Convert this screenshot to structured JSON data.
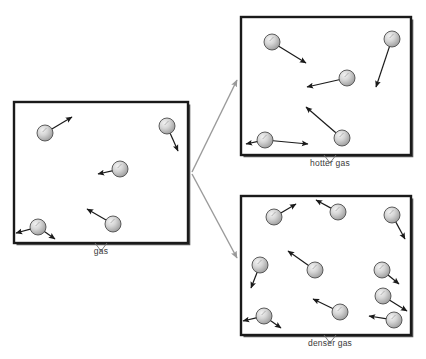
{
  "figure": {
    "background_color": "#ffffff",
    "box_border_color": "#1a1a1a",
    "particle_fill_light": "#e8e8e8",
    "particle_fill_dark": "#9a9a9a",
    "particle_outline": "#4d4d4d",
    "arrow_color": "#1a1a1a",
    "connector_color": "#9a9a9a",
    "label_color": "#3a3a3a"
  },
  "panels": [
    {
      "id": "gas",
      "label": "gas",
      "box": {
        "x": 14,
        "y": 102,
        "w": 174,
        "h": 141
      },
      "label_x": 101,
      "label_y": 246,
      "leader": {
        "from_x": 101,
        "from_y": 243,
        "left_x": 95,
        "right_x": 107,
        "tip_y": 251
      },
      "particle_count": 5,
      "particles": [
        {
          "cx": 45,
          "cy": 133,
          "r": 8,
          "ax": 27,
          "ay": -16
        },
        {
          "cx": 167,
          "cy": 126,
          "r": 8,
          "ax": 11,
          "ay": 25
        },
        {
          "cx": 120,
          "cy": 169,
          "r": 8,
          "ax": -22,
          "ay": 5
        },
        {
          "cx": 38,
          "cy": 227,
          "r": 8,
          "ax": -22,
          "ay": 6
        },
        {
          "cx": 113,
          "cy": 224,
          "r": 8,
          "ax": -26,
          "ay": -15
        }
      ],
      "extra_arrows": [
        {
          "x1": 38,
          "y1": 227,
          "x2": 55,
          "y2": 239
        }
      ]
    },
    {
      "id": "hotter-gas",
      "label": "hotter gas",
      "box": {
        "x": 241,
        "y": 17,
        "w": 170,
        "h": 138
      },
      "label_x": 330,
      "label_y": 158,
      "leader": {
        "from_x": 330,
        "from_y": 155,
        "left_x": 324,
        "right_x": 336,
        "tip_y": 163
      },
      "particle_count": 5,
      "particles": [
        {
          "cx": 272,
          "cy": 42,
          "r": 8,
          "ax": 34,
          "ay": 21
        },
        {
          "cx": 392,
          "cy": 39,
          "r": 8,
          "ax": -16,
          "ay": 48
        },
        {
          "cx": 347,
          "cy": 78,
          "r": 8,
          "ax": -40,
          "ay": 9
        },
        {
          "cx": 265,
          "cy": 140,
          "r": 8,
          "ax": -19,
          "ay": 4
        },
        {
          "cx": 342,
          "cy": 138,
          "r": 8,
          "ax": -36,
          "ay": -31
        }
      ],
      "extra_arrows": [
        {
          "x1": 265,
          "y1": 140,
          "x2": 308,
          "y2": 144
        }
      ]
    },
    {
      "id": "denser-gas",
      "label": "denser gas",
      "box": {
        "x": 241,
        "y": 196,
        "w": 170,
        "h": 139
      },
      "label_x": 330,
      "label_y": 338,
      "leader": {
        "from_x": 330,
        "from_y": 335,
        "left_x": 324,
        "right_x": 336,
        "tip_y": 343
      },
      "particle_count": 10,
      "particles": [
        {
          "cx": 274,
          "cy": 217,
          "r": 8,
          "ax": 22,
          "ay": -13
        },
        {
          "cx": 338,
          "cy": 212,
          "r": 8,
          "ax": -22,
          "ay": -12
        },
        {
          "cx": 392,
          "cy": 215,
          "r": 8,
          "ax": 13,
          "ay": 24
        },
        {
          "cx": 260,
          "cy": 265,
          "r": 8,
          "ax": -9,
          "ay": 23
        },
        {
          "cx": 315,
          "cy": 270,
          "r": 8,
          "ax": -27,
          "ay": -19
        },
        {
          "cx": 382,
          "cy": 270,
          "r": 8,
          "ax": 17,
          "ay": 14
        },
        {
          "cx": 383,
          "cy": 296,
          "r": 8,
          "ax": 24,
          "ay": 15
        },
        {
          "cx": 264,
          "cy": 316,
          "r": 8,
          "ax": -21,
          "ay": 5
        },
        {
          "cx": 340,
          "cy": 312,
          "r": 8,
          "ax": -27,
          "ay": -13
        },
        {
          "cx": 394,
          "cy": 320,
          "r": 8,
          "ax": -25,
          "ay": -4
        }
      ],
      "extra_arrows": [
        {
          "x1": 264,
          "y1": 316,
          "x2": 281,
          "y2": 328
        }
      ]
    }
  ],
  "connectors": [
    {
      "id": "to-hotter",
      "x1": 192,
      "y1": 172,
      "x2": 237,
      "y2": 80
    },
    {
      "id": "to-denser",
      "x1": 192,
      "y1": 174,
      "x2": 237,
      "y2": 258
    }
  ]
}
